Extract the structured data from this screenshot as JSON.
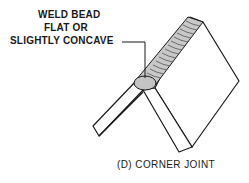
{
  "diagram": {
    "labels": {
      "line1": "WELD BEAD",
      "line2": "FLAT OR",
      "line3": "SLIGHTLY CONCAVE"
    },
    "caption": "(D) CORNER JOINT",
    "colors": {
      "stroke": "#1a1a1a",
      "bead_fill": "#c8c8c8",
      "plate_fill": "#ffffff"
    }
  }
}
